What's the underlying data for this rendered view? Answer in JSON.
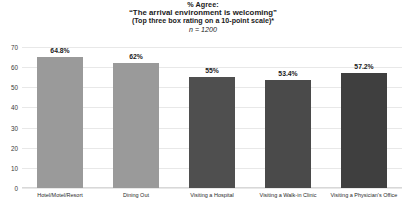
{
  "chart_data": {
    "type": "bar",
    "title": "% Agree:",
    "title_quoted": "“The arrival environment is welcoming”",
    "subtitle": "(Top three box rating on a 10-point scale)*",
    "sample_size_note": "n = 1200",
    "categories": [
      "Hotel/Motel/Resort",
      "Dining Out",
      "Visiting a Hospital",
      "Visiting a Walk-in Clinic",
      "Visiting a Physician's Office"
    ],
    "values": [
      64.8,
      62,
      55,
      53.4,
      57.2
    ],
    "value_labels": [
      "64.8%",
      "62%",
      "55%",
      "53.4%",
      "57.2%"
    ],
    "bar_colors": [
      "#9a9a9a",
      "#9a9a9a",
      "#4f4f4f",
      "#4a4a4a",
      "#3f3f3f"
    ],
    "xlabel": "",
    "ylabel": "",
    "ylim": [
      0,
      70
    ],
    "yticks": [
      0,
      10,
      20,
      30,
      40,
      50,
      60,
      70
    ],
    "ytick_labels": [
      "0",
      "10",
      "20",
      "30",
      "40",
      "50",
      "60",
      "70"
    ],
    "grid": true,
    "legend": false
  }
}
